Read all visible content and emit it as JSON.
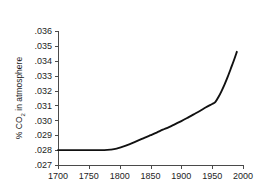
{
  "chart_data": {
    "type": "line",
    "title": "",
    "xlabel": "",
    "ylabel": "% CO2 in atmosphere",
    "ylabel_prefix": "% CO",
    "ylabel_subscript": "2",
    "ylabel_suffix": " in atmosphere",
    "xlim": [
      1700,
      2000
    ],
    "ylim": [
      0.027,
      0.036
    ],
    "xticks": [
      1700,
      1750,
      1800,
      1850,
      1900,
      1950,
      2000
    ],
    "xticklabels": [
      "1700",
      "1750",
      "1800",
      "1850",
      "1900",
      "1950",
      "2000"
    ],
    "yticks": [
      0.027,
      0.028,
      0.029,
      0.03,
      0.031,
      0.032,
      0.033,
      0.034,
      0.035,
      0.036
    ],
    "yticklabels": [
      ".027",
      ".028",
      ".029",
      ".030",
      ".031",
      ".032",
      ".033",
      ".034",
      ".035",
      ".036"
    ],
    "grid": false,
    "legend": null,
    "line_color": "#111111",
    "axis_color": "#4a4a4a",
    "background": "#ffffff",
    "x": [
      1700,
      1720,
      1740,
      1760,
      1775,
      1785,
      1795,
      1810,
      1825,
      1840,
      1850,
      1860,
      1870,
      1880,
      1890,
      1900,
      1910,
      1920,
      1930,
      1940,
      1950,
      1955,
      1960,
      1965,
      1970,
      1975,
      1980,
      1985,
      1990
    ],
    "values": [
      0.028,
      0.028,
      0.028,
      0.028,
      0.028,
      0.02803,
      0.0281,
      0.0283,
      0.02855,
      0.02882,
      0.029,
      0.02918,
      0.02937,
      0.02955,
      0.02975,
      0.02995,
      0.03017,
      0.0304,
      0.03063,
      0.03088,
      0.0311,
      0.03122,
      0.03155,
      0.03195,
      0.0324,
      0.0329,
      0.03345,
      0.034,
      0.0346
    ],
    "series_name": "CO2 concentration"
  },
  "geometry": {
    "plot_left": 58,
    "plot_right": 243,
    "plot_top": 31,
    "plot_bottom": 165
  }
}
